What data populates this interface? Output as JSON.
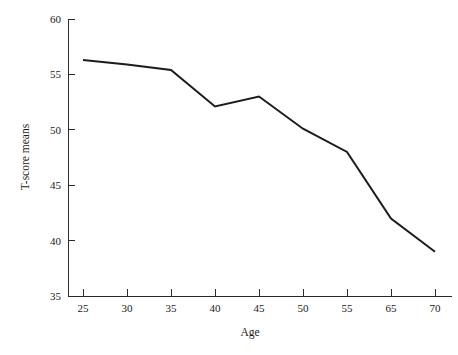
{
  "chart_data": {
    "type": "line",
    "title": "",
    "subtitle": "",
    "xlabel": "Age",
    "ylabel": "T-score means",
    "categories": [
      "25",
      "30",
      "35",
      "40",
      "45",
      "50",
      "55",
      "65",
      "70"
    ],
    "x_tick_labels": [
      "25",
      "30",
      "35",
      "40",
      "45",
      "50",
      "55",
      "65",
      "70"
    ],
    "y_tick_labels": [
      "35",
      "40",
      "45",
      "50",
      "55",
      "60"
    ],
    "y_ticks": [
      35,
      40,
      45,
      50,
      55,
      60
    ],
    "ylim": [
      35,
      60
    ],
    "grid": false,
    "legend": false,
    "legend_position": "none",
    "series": [
      {
        "name": "T-score means",
        "color": "#1c1c1c",
        "values": [
          56.3,
          55.9,
          55.4,
          52.1,
          53.0,
          50.1,
          48.0,
          42.0,
          39.0
        ]
      }
    ],
    "points": [
      {
        "x": "25",
        "y": 56.3
      },
      {
        "x": "30",
        "y": 55.9
      },
      {
        "x": "35",
        "y": 55.4
      },
      {
        "x": "40",
        "y": 52.1
      },
      {
        "x": "45",
        "y": 53.0
      },
      {
        "x": "50",
        "y": 50.1
      },
      {
        "x": "55",
        "y": 48.0
      },
      {
        "x": "65",
        "y": 42.0
      },
      {
        "x": "70",
        "y": 39.0
      }
    ],
    "annotations": []
  },
  "colors": {
    "line": "#1c1c1c",
    "axis": "#2b2b2b",
    "background": "#ffffff",
    "text": "#1a1a1a"
  }
}
